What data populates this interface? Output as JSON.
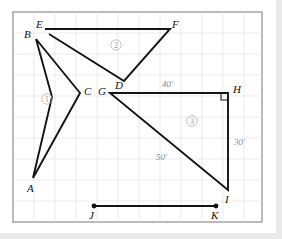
{
  "diagram": {
    "panel": {
      "x": 13,
      "y": 12,
      "width": 249,
      "height": 210
    },
    "grid": {
      "spacing": 21,
      "visible": true,
      "color": "#e2e2ea"
    },
    "stroke_color": "#141414",
    "dim_color": "#8a8a8a",
    "vertices": [
      {
        "id": "A",
        "label": "A",
        "x": 33,
        "y": 178,
        "label_x": 27,
        "label_y": 192
      },
      {
        "id": "B",
        "label": "B",
        "x": 36,
        "y": 39,
        "label_x": 24,
        "label_y": 38
      },
      {
        "id": "C",
        "label": "C",
        "x": 80,
        "y": 93,
        "label_x": 84,
        "label_y": 94
      },
      {
        "id": "D",
        "label": "D",
        "x": 124,
        "y": 81,
        "label_x": 115,
        "label_y": 89
      },
      {
        "id": "E",
        "label": "E",
        "x": 45,
        "y": 29,
        "label_x": 36,
        "label_y": 27
      },
      {
        "id": "F",
        "label": "F",
        "x": 170,
        "y": 29,
        "label_x": 173,
        "label_y": 27
      },
      {
        "id": "G",
        "label": "G",
        "x": 110,
        "y": 93,
        "label_x": 98,
        "label_y": 94
      },
      {
        "id": "H",
        "label": "H",
        "x": 228,
        "y": 93,
        "label_x": 233,
        "label_y": 92
      },
      {
        "id": "I",
        "label": "I",
        "x": 228,
        "y": 190,
        "label_x": 224,
        "label_y": 201
      },
      {
        "id": "J",
        "label": "J",
        "x": 94,
        "y": 206,
        "label_x": 89,
        "label_y": 218
      },
      {
        "id": "K",
        "label": "K",
        "x": 216,
        "y": 206,
        "label_x": 212,
        "label_y": 218
      }
    ],
    "shapes": [
      {
        "name": "arrowhead-region-1",
        "points": "36,39 80,93 33,178 52,97"
      },
      {
        "name": "arrowhead-region-2",
        "points": "45,29 170,29 124,81 50,35"
      },
      {
        "name": "right-triangle-region-3",
        "points": "110,93 228,93 228,190"
      },
      {
        "name": "segment-jk",
        "points": "94,206 216,206"
      }
    ],
    "right_angle": {
      "at": "H",
      "x": 218,
      "y": 93,
      "size": 7
    },
    "endpoint_dots": [
      {
        "at": "J",
        "x": 94,
        "y": 206,
        "r": 2.4
      },
      {
        "at": "K",
        "x": 216,
        "y": 206,
        "r": 2.4
      }
    ],
    "dimensions": [
      {
        "id": "GH",
        "label": "40'",
        "x": 170,
        "y": 86
      },
      {
        "id": "HI",
        "label": "30'",
        "x": 240,
        "y": 142
      },
      {
        "id": "GI",
        "label": "50'",
        "x": 163,
        "y": 157
      }
    ],
    "regions": [
      {
        "id": "region-1",
        "label": "1",
        "x": 47,
        "y": 99
      },
      {
        "id": "region-2",
        "label": "2",
        "x": 116,
        "y": 45
      },
      {
        "id": "region-3",
        "label": "3",
        "x": 192,
        "y": 121
      }
    ]
  }
}
